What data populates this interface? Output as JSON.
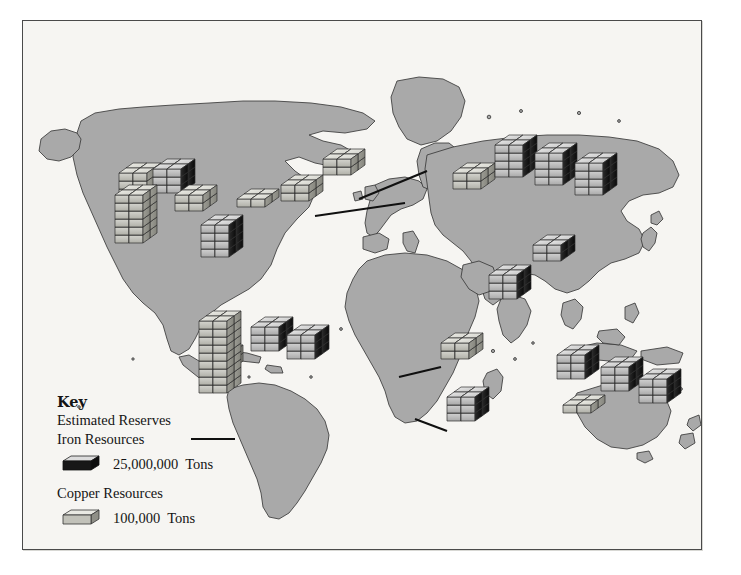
{
  "poster": {
    "title": "The World's Major Iron and Copper Resources",
    "background_color": "#f2f1ee",
    "border_color": "#4a4a4a",
    "land_color": "#a9a9a9",
    "ocean_color": "#f6f5f2",
    "coastline_color": "#3a3a3a"
  },
  "legend": {
    "key_label": "Key",
    "subtitle": "Estimated Reserves",
    "iron": {
      "label": "Iron Resources",
      "amount": "25,000,000",
      "unit": "Tons",
      "color": "#1a1a1a",
      "top_color": "#d8d8d8"
    },
    "copper": {
      "label": "Copper Resources",
      "amount": "100,000",
      "unit": "Tons",
      "color": "#b9b9b2",
      "top_color": "#e8e8e4"
    }
  },
  "chart_data": {
    "type": "map",
    "title": "The World's Major Iron and Copper Resources",
    "projection": "world",
    "units": {
      "iron_block": 25000000,
      "copper_block": 100000,
      "unit_name": "Tons"
    },
    "legend_entries": [
      {
        "name": "Iron Resources",
        "value_per_block": "25,000,000 Tons",
        "swatch": "dark"
      },
      {
        "name": "Copper Resources",
        "value_per_block": "100,000 Tons",
        "swatch": "light"
      }
    ],
    "markers": [
      {
        "region": "Canada - West",
        "resource": "copper",
        "stacks": 1,
        "blocks_high": 3,
        "columns": 2
      },
      {
        "region": "Canada - Central",
        "resource": "iron",
        "stacks": 1,
        "blocks_high": 3,
        "columns": 2
      },
      {
        "region": "Canada - East",
        "resource": "copper",
        "stacks": 1,
        "blocks_high": 2,
        "columns": 2
      },
      {
        "region": "Eastern Canada / Labrador",
        "resource": "copper",
        "stacks": 1,
        "blocks_high": 1,
        "columns": 2
      },
      {
        "region": "United States - West",
        "resource": "copper",
        "stacks": 1,
        "blocks_high": 6,
        "columns": 2
      },
      {
        "region": "United States - East",
        "resource": "iron",
        "stacks": 1,
        "blocks_high": 4,
        "columns": 2
      },
      {
        "region": "Sweden",
        "resource": "copper",
        "stacks": 1,
        "blocks_high": 2,
        "columns": 2,
        "leader": true
      },
      {
        "region": "Germany / Poland",
        "resource": "copper",
        "stacks": 1,
        "blocks_high": 2,
        "columns": 2,
        "leader": true
      },
      {
        "region": "Ukraine / Kazakhstan",
        "resource": "copper",
        "stacks": 1,
        "blocks_high": 2,
        "columns": 2
      },
      {
        "region": "Russia - Ural",
        "resource": "iron",
        "stacks": 1,
        "blocks_high": 4,
        "columns": 2
      },
      {
        "region": "Russia - Central Siberia",
        "resource": "iron",
        "stacks": 1,
        "blocks_high": 4,
        "columns": 2
      },
      {
        "region": "Russia - East Siberia",
        "resource": "iron",
        "stacks": 1,
        "blocks_high": 4,
        "columns": 2
      },
      {
        "region": "China",
        "resource": "iron",
        "stacks": 1,
        "blocks_high": 2,
        "columns": 2
      },
      {
        "region": "India",
        "resource": "iron",
        "stacks": 1,
        "blocks_high": 3,
        "columns": 2
      },
      {
        "region": "Peru",
        "resource": "copper",
        "stacks": 1,
        "blocks_high": 2,
        "columns": 2
      },
      {
        "region": "Chile",
        "resource": "copper",
        "stacks": 1,
        "blocks_high": 9,
        "columns": 2,
        "leader": true
      },
      {
        "region": "Brazil - West",
        "resource": "iron",
        "stacks": 1,
        "blocks_high": 3,
        "columns": 2
      },
      {
        "region": "Brazil - East",
        "resource": "iron",
        "stacks": 1,
        "blocks_high": 3,
        "columns": 2
      },
      {
        "region": "Zambia / DR Congo Copperbelt",
        "resource": "copper",
        "stacks": 1,
        "blocks_high": 2,
        "columns": 2,
        "leader": true
      },
      {
        "region": "South Africa",
        "resource": "iron",
        "stacks": 1,
        "blocks_high": 3,
        "columns": 2,
        "leader": true
      },
      {
        "region": "Australia - West",
        "resource": "iron",
        "stacks": 1,
        "blocks_high": 3,
        "columns": 2
      },
      {
        "region": "Australia - Central",
        "resource": "iron",
        "stacks": 1,
        "blocks_high": 3,
        "columns": 2
      },
      {
        "region": "Australia - East",
        "resource": "iron",
        "stacks": 1,
        "blocks_high": 3,
        "columns": 2
      },
      {
        "region": "Australia - South copper",
        "resource": "copper",
        "stacks": 1,
        "blocks_high": 1,
        "columns": 2
      }
    ]
  }
}
